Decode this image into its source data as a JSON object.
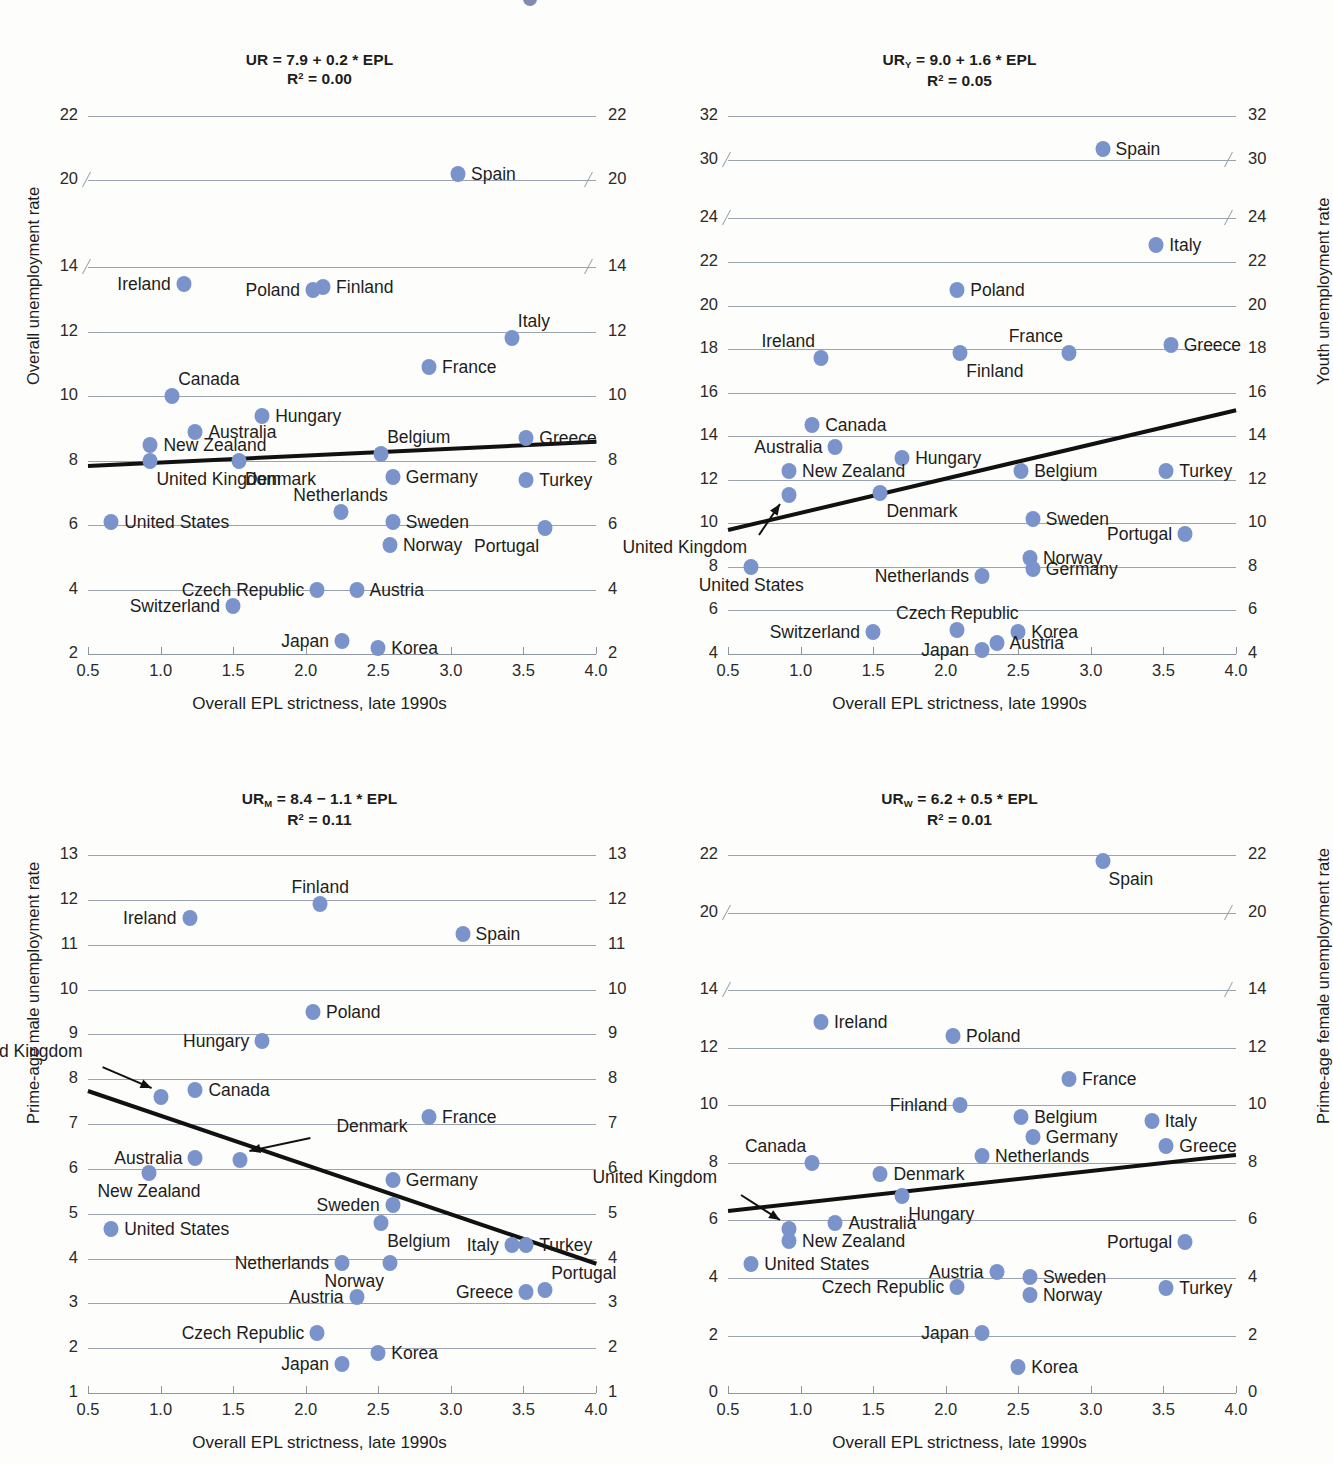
{
  "figure": {
    "xlabel": "Overall EPL strictness, late 1990s",
    "xticks": [
      "0.5",
      "1.0",
      "1.5",
      "2.0",
      "2.5",
      "3.0",
      "3.5",
      "4.0"
    ],
    "dot_color": "#7b93cb",
    "fit_color": "#111111",
    "grid_color": "#9aa3ae"
  },
  "chart_data": [
    {
      "id": "overall",
      "type": "scatter",
      "title_line1": "UR = 7.9 + 0.2 * EPL",
      "title_line2": "R2 = 0.00",
      "equation": "UR = 7.9 + 0.2 * EPL",
      "r2": 0.0,
      "intercept": 7.9,
      "slope": 0.2,
      "xlabel": "Overall EPL strictness, late 1990s",
      "ylabel_left": "Overall unemployment rate",
      "ylabel_right": "",
      "xlim": [
        0.5,
        4.0
      ],
      "xticks": [
        0.5,
        1.0,
        1.5,
        2.0,
        2.5,
        3.0,
        3.5,
        4.0
      ],
      "yticks": [
        2,
        4,
        6,
        8,
        10,
        12,
        14,
        20,
        22
      ],
      "axis_break": {
        "below": 14,
        "above": 20
      },
      "grid": true,
      "points": [
        {
          "name": "Spain",
          "x": 3.05,
          "y": 20.2,
          "label_side": "right"
        },
        {
          "name": "Ireland",
          "x": 1.16,
          "y": 13.5,
          "label_side": "left"
        },
        {
          "name": "Poland",
          "x": 2.05,
          "y": 13.3,
          "label_side": "left"
        },
        {
          "name": "Finland",
          "x": 2.12,
          "y": 13.4,
          "label_side": "right"
        },
        {
          "name": "Italy",
          "x": 3.42,
          "y": 11.8,
          "label_side": "above-right"
        },
        {
          "name": "France",
          "x": 2.85,
          "y": 10.9,
          "label_side": "right"
        },
        {
          "name": "Canada",
          "x": 1.08,
          "y": 10.0,
          "label_side": "above-right"
        },
        {
          "name": "Hungary",
          "x": 1.7,
          "y": 9.4,
          "label_side": "right"
        },
        {
          "name": "Australia",
          "x": 1.24,
          "y": 8.9,
          "label_side": "right"
        },
        {
          "name": "New Zealand",
          "x": 0.93,
          "y": 8.5,
          "label_side": "right"
        },
        {
          "name": "United Kingdom",
          "x": 0.93,
          "y": 8.0,
          "label_side": "below-right"
        },
        {
          "name": "Denmark",
          "x": 1.54,
          "y": 8.0,
          "label_side": "below-right"
        },
        {
          "name": "Belgium",
          "x": 2.52,
          "y": 8.2,
          "label_side": "above-right"
        },
        {
          "name": "Greece",
          "x": 3.52,
          "y": 8.7,
          "label_side": "right"
        },
        {
          "name": "Germany",
          "x": 2.6,
          "y": 7.5,
          "label_side": "right"
        },
        {
          "name": "Turkey",
          "x": 3.52,
          "y": 7.4,
          "label_side": "right"
        },
        {
          "name": "Netherlands",
          "x": 2.24,
          "y": 6.4,
          "label_side": "above"
        },
        {
          "name": "Sweden",
          "x": 2.6,
          "y": 6.1,
          "label_side": "right"
        },
        {
          "name": "United States",
          "x": 0.66,
          "y": 6.1,
          "label_side": "right"
        },
        {
          "name": "Portugal",
          "x": 3.65,
          "y": 5.9,
          "label_side": "below-left"
        },
        {
          "name": "Norway",
          "x": 2.58,
          "y": 5.4,
          "label_side": "right"
        },
        {
          "name": "Czech Republic",
          "x": 2.08,
          "y": 4.0,
          "label_side": "left"
        },
        {
          "name": "Austria",
          "x": 2.35,
          "y": 4.0,
          "label_side": "right"
        },
        {
          "name": "Switzerland",
          "x": 1.5,
          "y": 3.5,
          "label_side": "left"
        },
        {
          "name": "Japan",
          "x": 2.25,
          "y": 2.4,
          "label_side": "left"
        },
        {
          "name": "Korea",
          "x": 2.5,
          "y": 2.2,
          "label_side": "right"
        }
      ],
      "fit": {
        "x0": 0.5,
        "y0": 7.85,
        "x1": 4.0,
        "y1": 8.6
      }
    },
    {
      "id": "youth",
      "type": "scatter",
      "title_line1": "URY = 9.0 + 1.6 * EPL",
      "title_line2": "R2 = 0.05",
      "equation": "UR_Y = 9.0 + 1.6 * EPL",
      "r2": 0.05,
      "intercept": 9.0,
      "slope": 1.6,
      "xlabel": "Overall EPL strictness, late 1990s",
      "ylabel_left": "",
      "ylabel_right": "Youth unemployment rate",
      "xlim": [
        0.5,
        4.0
      ],
      "xticks": [
        0.5,
        1.0,
        1.5,
        2.0,
        2.5,
        3.0,
        3.5,
        4.0
      ],
      "yticks": [
        4,
        6,
        8,
        10,
        12,
        14,
        16,
        18,
        20,
        22,
        24,
        30,
        32
      ],
      "axis_break": {
        "below": 24,
        "above": 30
      },
      "grid": true,
      "points": [
        {
          "name": "Spain",
          "x": 3.08,
          "y": 30.5,
          "label_side": "right"
        },
        {
          "name": "Italy",
          "x": 3.45,
          "y": 22.8,
          "label_side": "right"
        },
        {
          "name": "Poland",
          "x": 2.08,
          "y": 20.7,
          "label_side": "right"
        },
        {
          "name": "Ireland",
          "x": 1.14,
          "y": 17.6,
          "label_side": "above-left"
        },
        {
          "name": "Finland",
          "x": 2.1,
          "y": 17.8,
          "label_side": "below-right"
        },
        {
          "name": "France",
          "x": 2.85,
          "y": 17.8,
          "label_side": "above-left"
        },
        {
          "name": "Greece",
          "x": 3.55,
          "y": 18.2,
          "label_side": "right"
        },
        {
          "name": "Canada",
          "x": 1.08,
          "y": 14.5,
          "label_side": "right"
        },
        {
          "name": "Australia",
          "x": 1.24,
          "y": 13.5,
          "label_side": "left"
        },
        {
          "name": "Hungary",
          "x": 1.7,
          "y": 13.0,
          "label_side": "right"
        },
        {
          "name": "New Zealand",
          "x": 0.92,
          "y": 12.4,
          "label_side": "right"
        },
        {
          "name": "Belgium",
          "x": 2.52,
          "y": 12.4,
          "label_side": "right"
        },
        {
          "name": "Turkey",
          "x": 3.52,
          "y": 12.4,
          "label_side": "right"
        },
        {
          "name": "United Kingdom",
          "x": 0.92,
          "y": 11.3,
          "label_side": "arrow"
        },
        {
          "name": "Denmark",
          "x": 1.55,
          "y": 11.4,
          "label_side": "below-right"
        },
        {
          "name": "Sweden",
          "x": 2.6,
          "y": 10.2,
          "label_side": "right"
        },
        {
          "name": "Portugal",
          "x": 3.65,
          "y": 9.5,
          "label_side": "left"
        },
        {
          "name": "Norway",
          "x": 2.58,
          "y": 8.4,
          "label_side": "right"
        },
        {
          "name": "United States",
          "x": 0.66,
          "y": 8.0,
          "label_side": "below"
        },
        {
          "name": "Germany",
          "x": 2.6,
          "y": 7.9,
          "label_side": "right"
        },
        {
          "name": "Netherlands",
          "x": 2.25,
          "y": 7.6,
          "label_side": "left"
        },
        {
          "name": "Czech Republic",
          "x": 2.08,
          "y": 5.1,
          "label_side": "above"
        },
        {
          "name": "Switzerland",
          "x": 1.5,
          "y": 5.0,
          "label_side": "left"
        },
        {
          "name": "Korea",
          "x": 2.5,
          "y": 5.0,
          "label_side": "right"
        },
        {
          "name": "Austria",
          "x": 2.35,
          "y": 4.5,
          "label_side": "right"
        },
        {
          "name": "Japan",
          "x": 2.25,
          "y": 4.2,
          "label_side": "left"
        }
      ],
      "fit": {
        "x0": 0.5,
        "y0": 9.7,
        "x1": 4.0,
        "y1": 15.2
      }
    },
    {
      "id": "prime-age-male",
      "type": "scatter",
      "title_line1": "URM = 8.4 - 1.1 * EPL",
      "title_line2": "R2 = 0.11",
      "equation": "UR_M = 8.4 - 1.1 * EPL",
      "r2": 0.11,
      "intercept": 8.4,
      "slope": -1.1,
      "xlabel": "Overall EPL strictness, late 1990s",
      "ylabel_left": "Prime-age male unemployment rate",
      "ylabel_right": "",
      "xlim": [
        0.5,
        4.0
      ],
      "xticks": [
        0.5,
        1.0,
        1.5,
        2.0,
        2.5,
        3.0,
        3.5,
        4.0
      ],
      "yticks": [
        1,
        2,
        3,
        4,
        5,
        6,
        7,
        8,
        9,
        10,
        11,
        12,
        13
      ],
      "axis_break": null,
      "grid": true,
      "points": [
        {
          "name": "Finland",
          "x": 2.1,
          "y": 11.9,
          "label_side": "above"
        },
        {
          "name": "Ireland",
          "x": 1.2,
          "y": 11.6,
          "label_side": "left"
        },
        {
          "name": "Spain",
          "x": 3.08,
          "y": 11.25,
          "label_side": "right"
        },
        {
          "name": "Poland",
          "x": 2.05,
          "y": 9.5,
          "label_side": "right"
        },
        {
          "name": "Hungary",
          "x": 1.7,
          "y": 8.85,
          "label_side": "left"
        },
        {
          "name": "Canada",
          "x": 1.24,
          "y": 7.75,
          "label_side": "right"
        },
        {
          "name": "United Kingdom",
          "x": 1.0,
          "y": 7.6,
          "label_side": "arrow"
        },
        {
          "name": "France",
          "x": 2.85,
          "y": 7.15,
          "label_side": "right"
        },
        {
          "name": "Australia",
          "x": 1.24,
          "y": 6.25,
          "label_side": "left"
        },
        {
          "name": "Denmark",
          "x": 1.55,
          "y": 6.2,
          "label_side": "arrow"
        },
        {
          "name": "New Zealand",
          "x": 0.92,
          "y": 5.9,
          "label_side": "below"
        },
        {
          "name": "Germany",
          "x": 2.6,
          "y": 5.75,
          "label_side": "right"
        },
        {
          "name": "Sweden",
          "x": 2.6,
          "y": 5.2,
          "label_side": "left"
        },
        {
          "name": "Belgium",
          "x": 2.52,
          "y": 4.8,
          "label_side": "below-right"
        },
        {
          "name": "United States",
          "x": 0.66,
          "y": 4.65,
          "label_side": "right"
        },
        {
          "name": "Italy",
          "x": 3.42,
          "y": 4.3,
          "label_side": "left"
        },
        {
          "name": "Turkey",
          "x": 3.52,
          "y": 4.3,
          "label_side": "right"
        },
        {
          "name": "Netherlands",
          "x": 2.25,
          "y": 3.9,
          "label_side": "left"
        },
        {
          "name": "Norway",
          "x": 2.58,
          "y": 3.9,
          "label_side": "below-left"
        },
        {
          "name": "Greece",
          "x": 3.52,
          "y": 3.25,
          "label_side": "left"
        },
        {
          "name": "Portugal",
          "x": 3.65,
          "y": 3.3,
          "label_side": "above-right"
        },
        {
          "name": "Austria",
          "x": 2.35,
          "y": 3.15,
          "label_side": "left"
        },
        {
          "name": "Czech Republic",
          "x": 2.08,
          "y": 2.35,
          "label_side": "left"
        },
        {
          "name": "Korea",
          "x": 2.5,
          "y": 1.9,
          "label_side": "right"
        },
        {
          "name": "Japan",
          "x": 2.25,
          "y": 1.65,
          "label_side": "left"
        }
      ],
      "fit": {
        "x0": 0.5,
        "y0": 7.75,
        "x1": 4.0,
        "y1": 3.9
      }
    },
    {
      "id": "prime-age-female",
      "type": "scatter",
      "title_line1": "URW = 6.2 + 0.5 * EPL",
      "title_line2": "R2 = 0.01",
      "equation": "UR_W = 6.2 + 0.5 * EPL",
      "r2": 0.01,
      "intercept": 6.2,
      "slope": 0.5,
      "xlabel": "Overall EPL strictness, late 1990s",
      "ylabel_left": "",
      "ylabel_right": "Prime-age female unemployment rate",
      "xlim": [
        0.5,
        4.0
      ],
      "xticks": [
        0.5,
        1.0,
        1.5,
        2.0,
        2.5,
        3.0,
        3.5,
        4.0
      ],
      "yticks": [
        0,
        2,
        4,
        6,
        8,
        10,
        12,
        14,
        20,
        22
      ],
      "axis_break": {
        "below": 14,
        "above": 20
      },
      "grid": true,
      "points": [
        {
          "name": "Spain",
          "x": 3.08,
          "y": 21.8,
          "label_side": "below-right"
        },
        {
          "name": "Ireland",
          "x": 1.14,
          "y": 12.9,
          "label_side": "right"
        },
        {
          "name": "Poland",
          "x": 2.05,
          "y": 12.4,
          "label_side": "right"
        },
        {
          "name": "France",
          "x": 2.85,
          "y": 10.9,
          "label_side": "right"
        },
        {
          "name": "Finland",
          "x": 2.1,
          "y": 10.0,
          "label_side": "left"
        },
        {
          "name": "Belgium",
          "x": 2.52,
          "y": 9.6,
          "label_side": "right"
        },
        {
          "name": "Italy",
          "x": 3.42,
          "y": 9.45,
          "label_side": "right"
        },
        {
          "name": "Germany",
          "x": 2.6,
          "y": 8.9,
          "label_side": "right"
        },
        {
          "name": "Greece",
          "x": 3.52,
          "y": 8.6,
          "label_side": "right"
        },
        {
          "name": "Netherlands",
          "x": 2.25,
          "y": 8.25,
          "label_side": "right"
        },
        {
          "name": "Canada",
          "x": 1.08,
          "y": 8.0,
          "label_side": "above-left"
        },
        {
          "name": "Denmark",
          "x": 1.55,
          "y": 7.6,
          "label_side": "right"
        },
        {
          "name": "Hungary",
          "x": 1.7,
          "y": 6.85,
          "label_side": "below-right"
        },
        {
          "name": "United Kingdom",
          "x": 0.92,
          "y": 5.7,
          "label_side": "arrow"
        },
        {
          "name": "Australia",
          "x": 1.24,
          "y": 5.9,
          "label_side": "right"
        },
        {
          "name": "New Zealand",
          "x": 0.92,
          "y": 5.3,
          "label_side": "right"
        },
        {
          "name": "Portugal",
          "x": 3.65,
          "y": 5.25,
          "label_side": "left"
        },
        {
          "name": "United States",
          "x": 0.66,
          "y": 4.5,
          "label_side": "right"
        },
        {
          "name": "Austria",
          "x": 2.35,
          "y": 4.2,
          "label_side": "left"
        },
        {
          "name": "Sweden",
          "x": 2.58,
          "y": 4.05,
          "label_side": "right"
        },
        {
          "name": "Czech Republic",
          "x": 2.08,
          "y": 3.7,
          "label_side": "left"
        },
        {
          "name": "Turkey",
          "x": 3.52,
          "y": 3.65,
          "label_side": "right"
        },
        {
          "name": "Norway",
          "x": 2.58,
          "y": 3.4,
          "label_side": "right"
        },
        {
          "name": "Japan",
          "x": 2.25,
          "y": 2.1,
          "label_side": "left"
        },
        {
          "name": "Korea",
          "x": 2.5,
          "y": 0.9,
          "label_side": "right"
        }
      ],
      "fit": {
        "x0": 0.5,
        "y0": 6.35,
        "x1": 4.0,
        "y1": 8.3
      }
    }
  ]
}
